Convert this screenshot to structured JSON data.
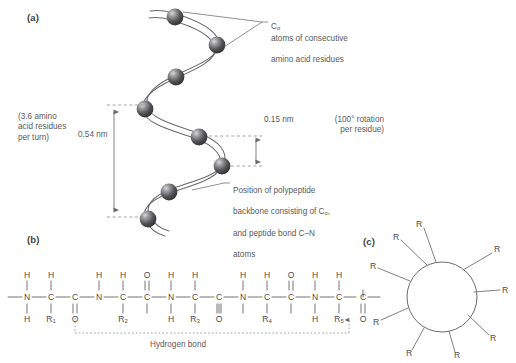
{
  "figure": {
    "panels": {
      "a": {
        "tag": "(a)"
      },
      "b": {
        "tag": "(b)"
      },
      "c": {
        "tag": "(c)"
      }
    }
  },
  "panel_a": {
    "label_calpha": "Cα atoms of consecutive\namino acid residues",
    "label_calpha_line1": "atoms of consecutive",
    "label_calpha_line2": "amino acid residues",
    "label_calpha_prefix": "C",
    "label_calpha_sub": "α",
    "label_turn": "(3.6 amino\nacid residues\nper turn)",
    "label_pitch": "0.54 nm",
    "label_rise": "0.15 nm",
    "label_rotation": "(100° rotation\nper residue)",
    "label_backbone_line1": "Position of polypeptide",
    "label_backbone_line2a": "backbone consisting of C",
    "label_backbone_sub": "α",
    "label_backbone_line2b": ",",
    "label_backbone_line3": "and peptide bond C–N",
    "label_backbone_line4": "atoms"
  },
  "panel_b": {
    "hydrogen_bond_label": "Hydrogen bond",
    "backbone_sequence": [
      "N",
      "C",
      "C",
      "N",
      "C",
      "C",
      "N",
      "C",
      "C",
      "N",
      "C",
      "C",
      "N",
      "C",
      "C"
    ],
    "side_groups": [
      "R1",
      "R2",
      "R3",
      "R4",
      "R5"
    ],
    "side_group_text": [
      "R",
      "R",
      "R",
      "R",
      "R"
    ],
    "side_group_subs": [
      "1",
      "2",
      "3",
      "4",
      "5"
    ],
    "amide_h": "H",
    "alpha_h": "H",
    "carbonyl_o": "O",
    "nitrogen": "N",
    "carbon": "C"
  },
  "panel_c": {
    "r_label": "R",
    "r_count": 9,
    "r_labels": [
      "R",
      "R",
      "R",
      "R",
      "R",
      "R",
      "R",
      "R",
      "R"
    ]
  },
  "colors": {
    "line": "#6b6b6d",
    "text": "#58585a",
    "sphere_dark": "#3a3a3c",
    "sphere_mid": "#6e6e70",
    "sphere_light": "#c9c9cb",
    "dashed": "#8d8d8f",
    "background": "#ffffff"
  }
}
